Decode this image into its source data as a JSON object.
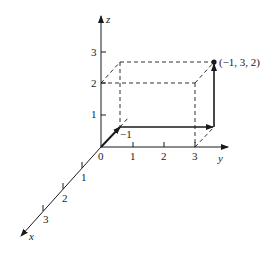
{
  "diagram": {
    "axes": {
      "x": {
        "label": "x",
        "ticks": [
          "1",
          "2",
          "3"
        ],
        "neg_tick": "−1"
      },
      "y": {
        "label": "y",
        "ticks": [
          "1",
          "2",
          "3"
        ]
      },
      "z": {
        "label": "z",
        "ticks": [
          "1",
          "2",
          "3"
        ]
      },
      "origin_label": "0"
    },
    "point": {
      "label": "(−1, 3, 2)",
      "coords": [
        -1,
        3,
        2
      ]
    },
    "box": {
      "x_range": [
        -1,
        0
      ],
      "y_range": [
        0,
        3
      ],
      "z_range": [
        0,
        2
      ],
      "style": "dashed"
    },
    "path_vectors": [
      {
        "from": [
          0,
          0,
          0
        ],
        "to": [
          -1,
          0,
          0
        ]
      },
      {
        "from": [
          -1,
          0,
          0
        ],
        "to": [
          -1,
          3,
          0
        ]
      },
      {
        "from": [
          -1,
          3,
          0
        ],
        "to": [
          -1,
          3,
          2
        ]
      }
    ],
    "colors": {
      "ink": "#1a1a1a",
      "background": "#ffffff"
    }
  }
}
